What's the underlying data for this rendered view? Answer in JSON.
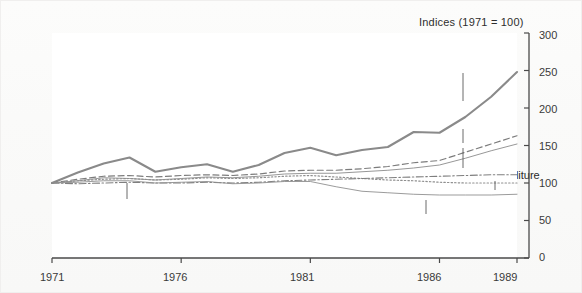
{
  "chart_data": {
    "type": "line",
    "title": "Indices (1971 = 100)",
    "xlabel": "",
    "ylabel": "",
    "xlim": [
      1971,
      1989
    ],
    "ylim": [
      0,
      300
    ],
    "ytick_labels": [
      "300",
      "250",
      "200",
      "150",
      "100",
      "50",
      "0"
    ],
    "yticks": [
      300,
      250,
      200,
      150,
      100,
      50,
      0
    ],
    "xtick_labels": [
      "1971",
      "1976",
      "1981",
      "1986",
      "1989"
    ],
    "xticks": [
      1971,
      1976,
      1981,
      1986,
      1989
    ],
    "grid": false,
    "legend_position": "inline-annotations",
    "x": [
      1971,
      1972,
      1973,
      1974,
      1975,
      1976,
      1977,
      1978,
      1979,
      1980,
      1981,
      1982,
      1983,
      1984,
      1985,
      1986,
      1987,
      1988,
      1989
    ],
    "series": [
      {
        "name": "Durable goods",
        "style": "solid-thick",
        "color": "#8a8a8a",
        "values": [
          100,
          114,
          126,
          134,
          115,
          121,
          125,
          115,
          124,
          140,
          147,
          137,
          144,
          148,
          168,
          167,
          188,
          215,
          248
        ]
      },
      {
        "name": "Services",
        "style": "dashed",
        "color": "#7c7c7c",
        "values": [
          100,
          105,
          109,
          110,
          108,
          110,
          111,
          110,
          112,
          116,
          117,
          117,
          119,
          122,
          127,
          130,
          141,
          152,
          163
        ]
      },
      {
        "name": "Total consumer's expenditure",
        "style": "solid-thin",
        "color": "#8b8b8b",
        "values": [
          100,
          103,
          107,
          106,
          104,
          106,
          108,
          107,
          109,
          112,
          113,
          113,
          115,
          117,
          120,
          124,
          133,
          143,
          152
        ]
      },
      {
        "name": "Food",
        "style": "dotted",
        "color": "#8f8f8f",
        "values": [
          100,
          103,
          105,
          106,
          104,
          105,
          107,
          106,
          107,
          109,
          110,
          108,
          106,
          104,
          103,
          101,
          100,
          100,
          100
        ]
      },
      {
        "name": "Beer",
        "style": "dash-dot",
        "color": "#7f7f7f",
        "values": [
          100,
          99,
          100,
          101,
          100,
          100,
          101,
          100,
          101,
          103,
          104,
          105,
          106,
          107,
          108,
          109,
          110,
          111,
          111
        ]
      },
      {
        "name": "Tobacco",
        "style": "solid-thin",
        "color": "#909090",
        "values": [
          100,
          101,
          103,
          103,
          100,
          101,
          102,
          99,
          100,
          102,
          102,
          95,
          89,
          87,
          85,
          84,
          84,
          84,
          85
        ]
      }
    ],
    "annotations": [
      {
        "text": "Durable goods",
        "series": "Durable goods"
      },
      {
        "text": "Services",
        "series": "Services"
      },
      {
        "text": "Total consumer's expenditure",
        "series": "Total consumer's expenditure"
      },
      {
        "text": "Food",
        "series": "Food"
      },
      {
        "text": "Beer",
        "series": "Beer"
      },
      {
        "text": "Tobacco",
        "series": "Tobacco"
      }
    ]
  },
  "axis": {
    "y_labels": [
      "300",
      "250",
      "200",
      "150",
      "100",
      "50",
      "0"
    ],
    "x_labels": [
      "1971",
      "1976",
      "1981",
      "1986",
      "1989"
    ]
  },
  "labels": {
    "title": "Indices (1971 = 100)",
    "durable_goods": "Durable goods",
    "services": "Services",
    "total_consumers_expenditure": "Total consumer's expenditure",
    "food": "Food",
    "beer": "Beer",
    "tobacco": "Tobacco"
  }
}
